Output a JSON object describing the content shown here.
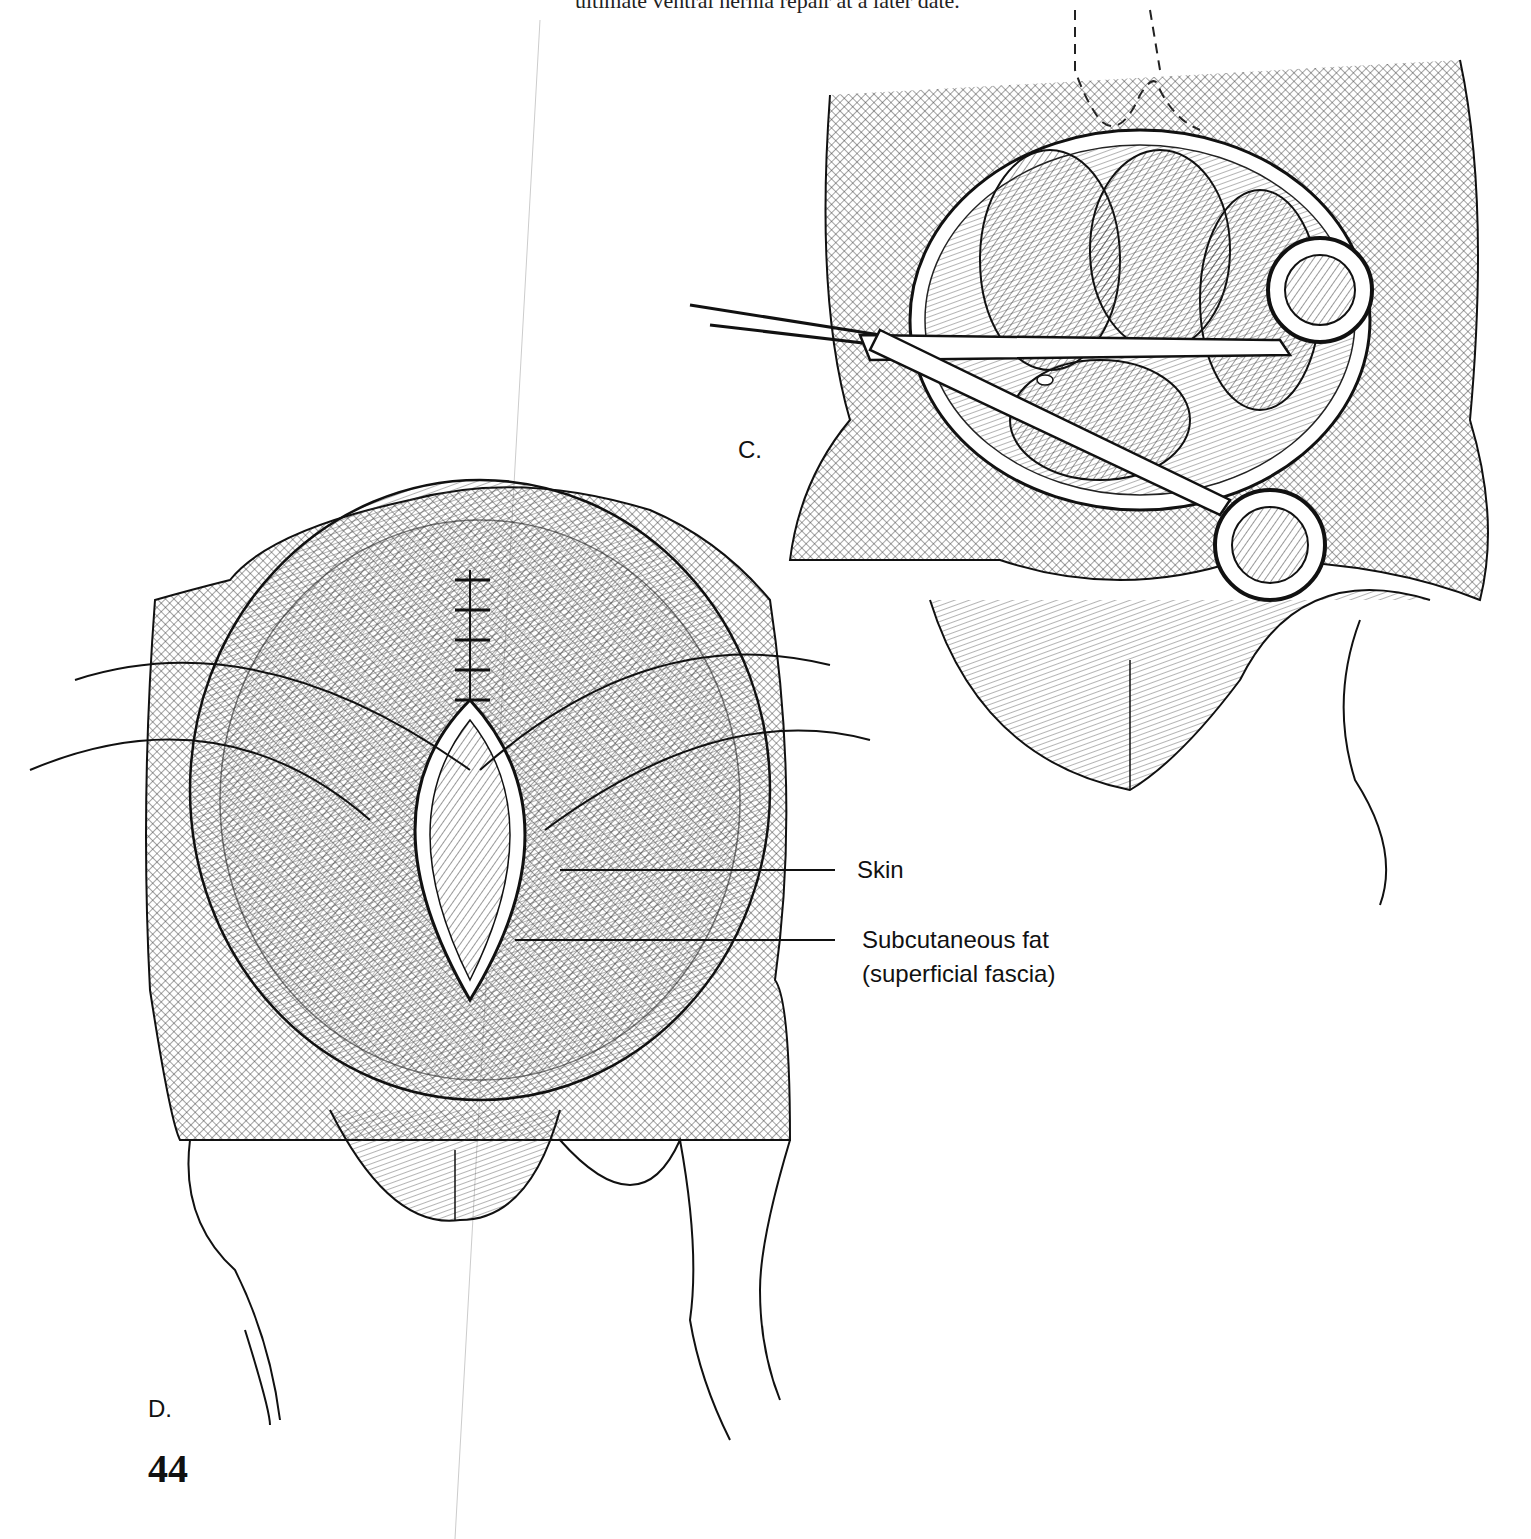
{
  "page": {
    "running_text": "ultimate ventral hernia repair at a later date.",
    "page_number": "44"
  },
  "figures": [
    {
      "panel_label": "C.",
      "description": "Scissors inserted into exposed abdominal cavity with bowel loops"
    },
    {
      "panel_label": "D.",
      "description": "Closure of abdominal wall with sutures; incision edges showing skin and subcutaneous fat"
    }
  ],
  "annotations": {
    "skin": "Skin",
    "subcutaneous_fat_line1": "Subcutaneous fat",
    "subcutaneous_fat_line2": "(superficial fascia)"
  }
}
